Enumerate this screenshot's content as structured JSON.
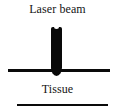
{
  "figure": {
    "title": "Laser beam",
    "caption": "Tissue",
    "background_color": "#ffffff",
    "ink_color": "#0a0a0a",
    "width_px": 115,
    "height_px": 112
  },
  "diagram": {
    "type": "schematic",
    "elements": [
      {
        "name": "laser-beam",
        "shape": "vertical bar with rounded lower tip",
        "color": "#090909",
        "x_px": 51,
        "y_px": 27,
        "width_px": 11,
        "height_px": 49
      },
      {
        "name": "tissue-surface-line",
        "shape": "horizontal rule",
        "color": "#0a0a0a",
        "x_px": 8,
        "y_px": 69,
        "width_px": 102,
        "thickness_px": 3
      },
      {
        "name": "lower-boundary-line",
        "shape": "horizontal rule",
        "color": "#0a0a0a",
        "x_px": 17,
        "y_px": 104,
        "width_px": 91,
        "thickness_px": 2
      }
    ]
  }
}
